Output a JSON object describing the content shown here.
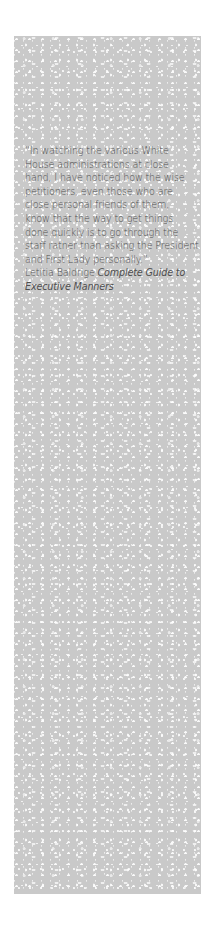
{
  "quote": {
    "lines": [
      "“In watching the various White",
      "House administrations at close",
      "hand, I have noticed how the wise",
      "petitioners, even those who are",
      "close personal friends of them,",
      "know that the way to get things",
      "done quickly is to go through the",
      "staff rather than asking the President",
      "and First Lady personally.”"
    ],
    "author": "Letitia Baldrige",
    "source_line1": "Complete Guide to",
    "source_line2": "Executive Manners"
  },
  "colors": {
    "panel": "#c9c9c9",
    "text": "#4f4f4f",
    "background": "#ffffff"
  }
}
